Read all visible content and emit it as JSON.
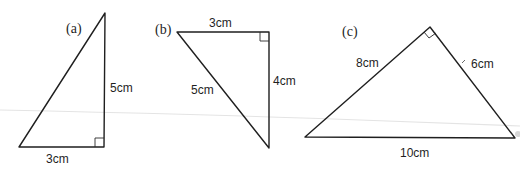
{
  "figure": {
    "stroke_color": "#1f1f1f",
    "triangles": [
      {
        "id": "a",
        "part_label": "(a)",
        "vertices": {
          "apex": [
            105,
            13
          ],
          "right_angle": [
            104,
            147
          ],
          "left": [
            19,
            147
          ]
        },
        "right_angle_at": "bottom-right",
        "sides": [
          {
            "label": "5cm",
            "between": "apex-right_angle",
            "orientation": "vertical"
          },
          {
            "label": "3cm",
            "between": "left-right_angle",
            "orientation": "horizontal"
          }
        ]
      },
      {
        "id": "b",
        "part_label": "(b)",
        "vertices": {
          "top_left": [
            177,
            32
          ],
          "right_angle": [
            269,
            32
          ],
          "bottom": [
            269,
            148
          ]
        },
        "right_angle_at": "top-right",
        "sides": [
          {
            "label": "3cm",
            "between": "top_left-right_angle",
            "orientation": "horizontal"
          },
          {
            "label": "4cm",
            "between": "right_angle-bottom",
            "orientation": "vertical"
          },
          {
            "label": "5cm",
            "between": "top_left-bottom",
            "orientation": "diagonal"
          }
        ]
      },
      {
        "id": "c",
        "part_label": "(c)",
        "vertices": {
          "right_angle": [
            430,
            27
          ],
          "left": [
            305,
            137
          ],
          "right": [
            515,
            138
          ]
        },
        "right_angle_at": "apex",
        "sides": [
          {
            "label": "8cm",
            "between": "left-right_angle",
            "orientation": "diagonal"
          },
          {
            "label": "6cm",
            "between": "right_angle-right",
            "orientation": "diagonal"
          },
          {
            "label": "10cm",
            "between": "left-right",
            "orientation": "horizontal"
          }
        ]
      }
    ]
  },
  "labels": {
    "a_part": "(a)",
    "a_side_vertical": "5cm",
    "a_side_base": "3cm",
    "b_part": "(b)",
    "b_side_top": "3cm",
    "b_side_vertical": "4cm",
    "b_side_hypotenuse": "5cm",
    "c_part": "(c)",
    "c_side_left": "8cm",
    "c_side_right": "6cm",
    "c_side_base": "10cm"
  }
}
